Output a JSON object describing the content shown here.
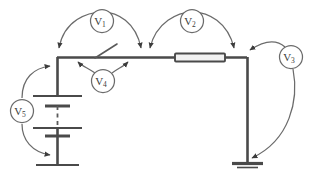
{
  "diagram": {
    "type": "electrical-schematic",
    "background_color": "#ffffff",
    "wire_color": "#4a4a4a",
    "arc_color": "#6b6b6b",
    "label_color": "#3a3a3a"
  },
  "meters": [
    {
      "id": "v1",
      "symbol": "V",
      "subscript": "1",
      "label": "V1",
      "cx": 102,
      "cy": 21,
      "r": 11.5,
      "measures": "top-left-wire-segment"
    },
    {
      "id": "v2",
      "symbol": "V",
      "subscript": "2",
      "label": "V2",
      "cx": 192,
      "cy": 21,
      "r": 11.5,
      "measures": "resistor-segment"
    },
    {
      "id": "v3",
      "symbol": "V",
      "subscript": "3",
      "label": "V3",
      "cx": 291,
      "cy": 57,
      "r": 11.5,
      "measures": "right-vertical-branch"
    },
    {
      "id": "v4",
      "symbol": "V",
      "subscript": "4",
      "label": "V4",
      "cx": 103,
      "cy": 81,
      "r": 11.5,
      "measures": "switch"
    },
    {
      "id": "v5",
      "symbol": "V",
      "subscript": "5",
      "label": "V5",
      "cx": 22,
      "cy": 111,
      "r": 11.5,
      "measures": "battery-source"
    }
  ],
  "components": [
    {
      "id": "battery",
      "name": "battery-stack",
      "type": "multi-cell-battery",
      "x": 57,
      "y_top": 85,
      "y_bottom": 165,
      "note": "dashed center indicates repeated cells"
    },
    {
      "id": "switch",
      "name": "switch",
      "type": "spst-switch",
      "x": 105,
      "y": 57,
      "note": "open blade on top wire"
    },
    {
      "id": "resistor",
      "name": "resistor",
      "type": "resistor",
      "x": 175,
      "y": 57,
      "width": 50,
      "height": 8
    },
    {
      "id": "ground",
      "name": "ground",
      "type": "ground-symbol",
      "x": 247,
      "y": 162
    }
  ],
  "nodes": {
    "top_left": {
      "x": 57,
      "y": 57
    },
    "top_right": {
      "x": 247,
      "y": 57
    },
    "mid_junction": {
      "x": 142,
      "y": 57
    },
    "bottom_right": {
      "x": 247,
      "y": 162
    }
  }
}
